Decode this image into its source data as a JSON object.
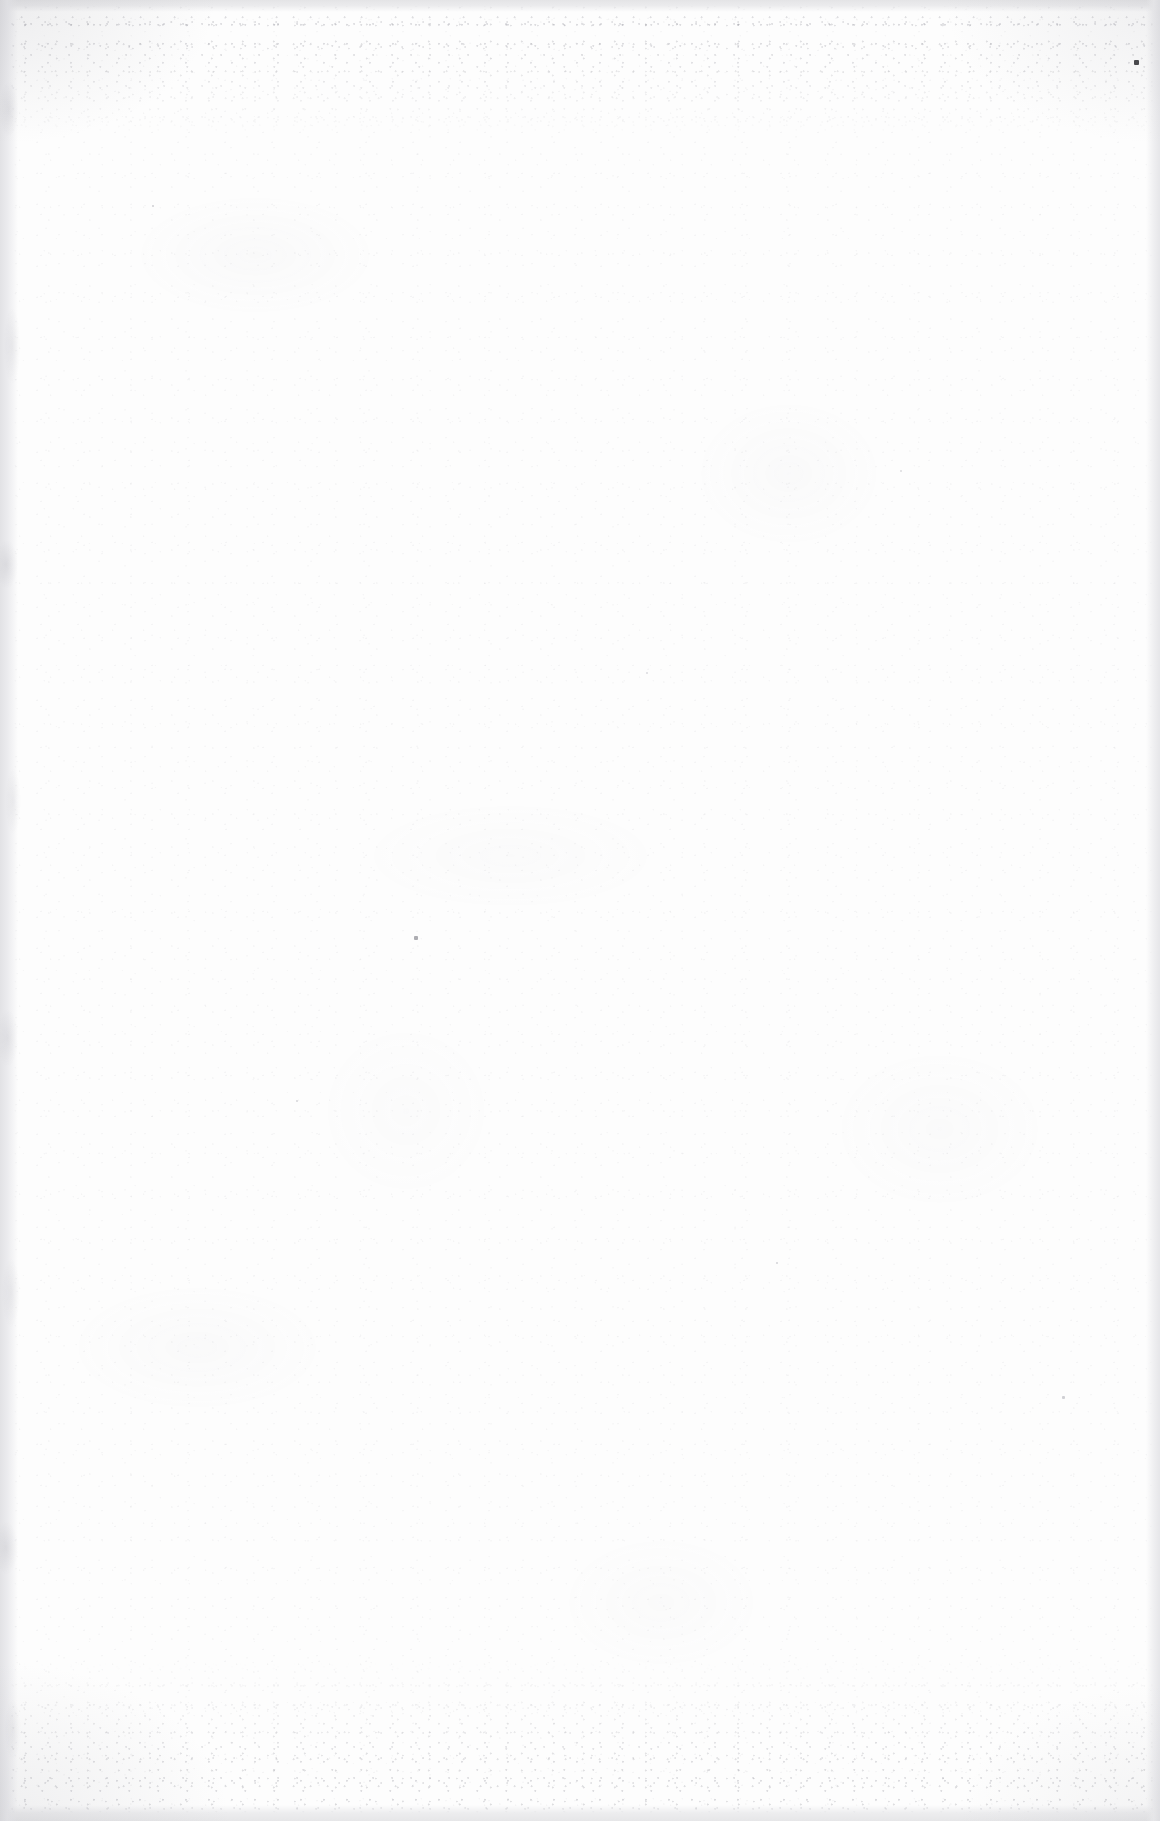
{
  "document": {
    "kind": "blank-scanned-page",
    "description": "Blank white scanned sheet with paper grain and scanner edge bands",
    "visible_text": "",
    "page_width": 1160,
    "page_height": 1821,
    "orientation": "portrait"
  },
  "appearance": {
    "paper_color": "#fdfdfd",
    "grain_color": "#96969e",
    "edge_band_color": "#e4e4e6",
    "vignette_color": "#96969e",
    "artifact_color": "#3a3a3e"
  },
  "edges": {
    "top": {
      "name": "top-scanner-band",
      "height_px": 12,
      "color": "#e4e4e6"
    },
    "bottom": {
      "name": "bottom-scanner-band",
      "height_px": 16,
      "color": "#e6e6e8"
    },
    "left": {
      "name": "left-scanner-band",
      "width_px": 18,
      "color": "#e2e2e5"
    },
    "right": {
      "name": "right-scanner-band",
      "width_px": 14,
      "color": "#e6e6e9"
    }
  },
  "noise_bands": [
    {
      "name": "top-speckle-band",
      "top_px": 0,
      "height_px": 140
    },
    {
      "name": "bottom-speckle-band",
      "bottom_px": 0,
      "height_px": 160
    }
  ],
  "artifacts": [
    {
      "name": "dust-speck-primary",
      "x": 1134,
      "y": 60,
      "size": 5,
      "color": "#3a3a3e",
      "opacity": 0.92
    },
    {
      "name": "dust-speck-secondary",
      "x": 414,
      "y": 936,
      "size": 4,
      "color": "#8a8a92",
      "opacity": 0.7
    },
    {
      "name": "dust-speck-micro-a",
      "x": 152,
      "y": 205,
      "size": 2,
      "color": "#a8a8b0",
      "opacity": 0.55
    },
    {
      "name": "dust-speck-micro-b",
      "x": 776,
      "y": 1262,
      "size": 2,
      "color": "#a8a8b0",
      "opacity": 0.5
    },
    {
      "name": "dust-speck-micro-c",
      "x": 1062,
      "y": 1396,
      "size": 3,
      "color": "#9a9aa2",
      "opacity": 0.45
    },
    {
      "name": "dust-speck-micro-d",
      "x": 296,
      "y": 1100,
      "size": 2,
      "color": "#aaaab2",
      "opacity": 0.48
    },
    {
      "name": "dust-speck-micro-e",
      "x": 646,
      "y": 672,
      "size": 2,
      "color": "#acacb4",
      "opacity": 0.42
    },
    {
      "name": "dust-speck-micro-f",
      "x": 900,
      "y": 470,
      "size": 2,
      "color": "#aaaab2",
      "opacity": 0.4
    }
  ]
}
